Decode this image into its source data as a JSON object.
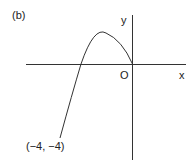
{
  "figure": {
    "panel_label": "(b)",
    "axes": {
      "x_label": "x",
      "y_label": "y",
      "origin_label": "O"
    },
    "curve": {
      "description": "downward-opening parabola through origin",
      "start_point_label": "(−4, −4)",
      "ends_at": "origin"
    },
    "colors": {
      "line": "#333333",
      "background": "#ffffff"
    }
  }
}
